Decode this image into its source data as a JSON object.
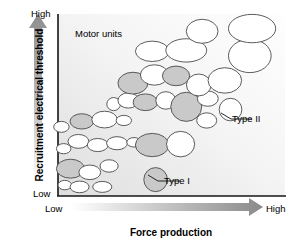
{
  "figure": {
    "title_x": "Force production",
    "title_y": "Recruitment electrical threshold",
    "plot_note": "Motor units",
    "ticks": {
      "y_high": "High",
      "y_low": "Low",
      "x_low": "Low",
      "x_high": "High"
    },
    "callouts": {
      "type_i": "Type I",
      "type_ii": "Type II"
    },
    "colors": {
      "axis_line": "#1a1a1a",
      "plot_background_light": "#fdfdfd",
      "plot_background_dark": "#e2e2e2",
      "ellipse_outline": "#4a4a4a",
      "ellipse_fill_white": "#ffffff",
      "ellipse_fill_gray": "#c9c9c9",
      "arrow_dark": "#8c8c8c",
      "arrow_light": "#ffffff",
      "text": "#000000"
    }
  },
  "chart_data": {
    "type": "scatter",
    "title": "",
    "xlabel": "Force production",
    "ylabel": "Recruitment electrical threshold",
    "xlim": [
      0,
      100
    ],
    "ylim": [
      0,
      100
    ],
    "xticks": [
      "Low",
      "High"
    ],
    "yticks": [
      "Low",
      "High"
    ],
    "grid": false,
    "legend": null,
    "annotations": [
      {
        "text": "Motor units",
        "x": 10,
        "y": 92
      },
      {
        "text": "Type I",
        "x": 48,
        "y": 10
      },
      {
        "text": "Type II",
        "x": 78,
        "y": 45
      }
    ],
    "encoding": {
      "note": "Each marker is a motor unit drawn as an ellipse; marker size encodes motor unit size and fill encodes fiber type",
      "fill_gray_meaning": "shaded motor unit",
      "fill_white_meaning": "unshaded motor unit"
    },
    "series": [
      {
        "name": "Motor units",
        "points": [
          {
            "x": 3.0,
            "y": 6.0,
            "rx": 3.0,
            "ry": 2.6,
            "fill": "white"
          },
          {
            "x": 9.5,
            "y": 5.0,
            "rx": 4.2,
            "ry": 3.2,
            "fill": "white"
          },
          {
            "x": 19.5,
            "y": 5.0,
            "rx": 4.2,
            "ry": 3.0,
            "fill": "white"
          },
          {
            "x": 5.5,
            "y": 15.0,
            "rx": 6.2,
            "ry": 5.2,
            "fill": "gray"
          },
          {
            "x": 14.0,
            "y": 13.0,
            "rx": 4.8,
            "ry": 4.0,
            "fill": "white"
          },
          {
            "x": 22.5,
            "y": 16.5,
            "rx": 4.0,
            "ry": 3.4,
            "fill": "white"
          },
          {
            "x": 2.5,
            "y": 26.0,
            "rx": 3.2,
            "ry": 2.8,
            "fill": "white"
          },
          {
            "x": 9.0,
            "y": 30.0,
            "rx": 4.6,
            "ry": 3.8,
            "fill": "white"
          },
          {
            "x": 17.5,
            "y": 28.0,
            "rx": 4.6,
            "ry": 3.6,
            "fill": "white"
          },
          {
            "x": 26.0,
            "y": 29.0,
            "rx": 4.6,
            "ry": 3.6,
            "fill": "white"
          },
          {
            "x": 33.5,
            "y": 29.5,
            "rx": 3.2,
            "ry": 2.6,
            "fill": "white"
          },
          {
            "x": 41.5,
            "y": 28.0,
            "rx": 7.4,
            "ry": 6.4,
            "fill": "gray"
          },
          {
            "x": 54.0,
            "y": 28.5,
            "rx": 6.2,
            "ry": 7.0,
            "fill": "white"
          },
          {
            "x": 43.0,
            "y": 9.0,
            "rx": 5.2,
            "ry": 6.6,
            "fill": "gray"
          },
          {
            "x": 1.5,
            "y": 38.0,
            "rx": 3.4,
            "ry": 3.0,
            "fill": "white"
          },
          {
            "x": 10.5,
            "y": 41.0,
            "rx": 5.2,
            "ry": 4.2,
            "fill": "gray"
          },
          {
            "x": 20.5,
            "y": 42.0,
            "rx": 5.6,
            "ry": 4.6,
            "fill": "white"
          },
          {
            "x": 29.0,
            "y": 41.5,
            "rx": 3.4,
            "ry": 2.8,
            "fill": "white"
          },
          {
            "x": 24.5,
            "y": 50.5,
            "rx": 3.0,
            "ry": 3.6,
            "fill": "white"
          },
          {
            "x": 31.0,
            "y": 52.5,
            "rx": 4.6,
            "ry": 4.2,
            "fill": "white"
          },
          {
            "x": 38.5,
            "y": 51.5,
            "rx": 5.4,
            "ry": 4.6,
            "fill": "gray"
          },
          {
            "x": 47.5,
            "y": 52.5,
            "rx": 4.4,
            "ry": 4.8,
            "fill": "white"
          },
          {
            "x": 56.5,
            "y": 49.0,
            "rx": 6.8,
            "ry": 8.0,
            "fill": "gray"
          },
          {
            "x": 66.0,
            "y": 53.5,
            "rx": 4.6,
            "ry": 4.2,
            "fill": "white"
          },
          {
            "x": 65.5,
            "y": 41.5,
            "rx": 4.4,
            "ry": 4.2,
            "fill": "white"
          },
          {
            "x": 76.0,
            "y": 47.5,
            "rx": 5.0,
            "ry": 6.2,
            "fill": "white"
          },
          {
            "x": 33.0,
            "y": 62.0,
            "rx": 6.6,
            "ry": 6.0,
            "fill": "gray"
          },
          {
            "x": 42.5,
            "y": 66.5,
            "rx": 6.2,
            "ry": 5.6,
            "fill": "white"
          },
          {
            "x": 52.0,
            "y": 66.0,
            "rx": 6.0,
            "ry": 5.4,
            "fill": "gray"
          },
          {
            "x": 62.0,
            "y": 61.0,
            "rx": 5.4,
            "ry": 6.0,
            "fill": "white"
          },
          {
            "x": 73.5,
            "y": 63.5,
            "rx": 7.4,
            "ry": 7.0,
            "fill": "white"
          },
          {
            "x": 41.5,
            "y": 79.5,
            "rx": 7.4,
            "ry": 5.6,
            "fill": "white"
          },
          {
            "x": 56.5,
            "y": 80.0,
            "rx": 9.0,
            "ry": 6.4,
            "fill": "white"
          },
          {
            "x": 84.5,
            "y": 77.0,
            "rx": 9.4,
            "ry": 9.2,
            "fill": "white"
          },
          {
            "x": 63.5,
            "y": 90.5,
            "rx": 7.0,
            "ry": 6.6,
            "fill": "white"
          },
          {
            "x": 85.5,
            "y": 92.0,
            "rx": 10.4,
            "ry": 7.8,
            "fill": "white"
          }
        ]
      }
    ]
  }
}
